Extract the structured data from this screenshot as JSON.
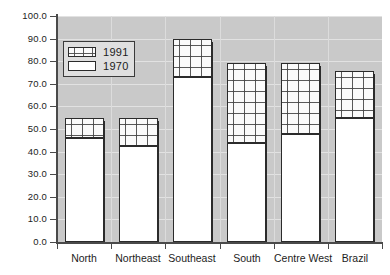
{
  "chart_data": {
    "type": "bar",
    "subtype": "stacked-bar",
    "title": "",
    "subtitle": "",
    "xlabel": "",
    "ylabel": "",
    "categories": [
      "North",
      "Northeast",
      "Southeast",
      "South",
      "Centre West",
      "Brazil"
    ],
    "series": [
      {
        "name": "1970",
        "values": [
          46.0,
          42.5,
          73.0,
          44.0,
          48.0,
          55.0
        ]
      },
      {
        "name": "1991",
        "values": [
          55.0,
          55.0,
          90.0,
          79.0,
          79.0,
          75.5
        ]
      }
    ],
    "stack_note": "1991 bar is drawn as the full bar total; the white 1970 segment is the lower portion and the stippled 1991 segment spans from the 1970 value up to the 1991 value",
    "ylim": [
      0.0,
      100.0
    ],
    "ytick_values": [
      0.0,
      10.0,
      20.0,
      30.0,
      40.0,
      50.0,
      60.0,
      70.0,
      80.0,
      90.0,
      100.0
    ],
    "ytick_labels": [
      "0.0",
      "10.0",
      "20.0",
      "30.0",
      "40.0",
      "50.0",
      "60.0",
      "70.0",
      "80.0",
      "90.0",
      "100.0"
    ],
    "grid": true,
    "grid_axis": "both",
    "legend_position": "upper-left-inside",
    "legend_entries": [
      {
        "label": "1991",
        "pattern": "dotted",
        "fill": "#fbfbfb"
      },
      {
        "label": "1970",
        "pattern": "solid",
        "fill": "#ffffff"
      }
    ],
    "colors": {
      "plot_background": "#c9c9c9",
      "gridline": "#e2e2e2",
      "bar_outline": "#2b2b2b",
      "bar_1970_fill": "#ffffff",
      "bar_1991_fill": "#fbfbfb",
      "axis": "#4a4a4a",
      "text": "#1c1c1c",
      "legend_background": "#dfdfdf"
    }
  }
}
